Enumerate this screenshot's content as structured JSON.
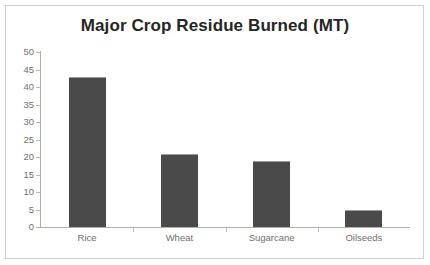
{
  "figure": {
    "background_color": "#ffffff",
    "frame_color": "#cfcfcf",
    "title": "Major Crop Residue Burned (MT)"
  },
  "chart_data": {
    "type": "bar",
    "title": "Major Crop Residue Burned (MT)",
    "subtitle": "",
    "xlabel": "",
    "ylabel": "",
    "categories": [
      "Rice",
      "Wheat",
      "Sugarcane",
      "Oilseeds"
    ],
    "values": [
      43,
      21,
      19,
      5
    ],
    "series": [
      {
        "name": "Major Crop Residue Burned (MT)",
        "values": [
          43,
          21,
          19,
          5
        ],
        "color": "#4a4a4a"
      }
    ],
    "ylim": [
      0,
      50
    ],
    "ytick_step": 5,
    "ytick_labels": [
      "50",
      "45",
      "40",
      "35",
      "30",
      "25",
      "20",
      "15",
      "10",
      "5",
      "0"
    ],
    "ytick_values": [
      50,
      45,
      40,
      35,
      30,
      25,
      20,
      15,
      10,
      5,
      0
    ],
    "grid": false,
    "legend": false,
    "legend_position": "none",
    "axis_color": "#b0b0b0",
    "tick_label_color": "#6f6f6f",
    "annotations": [],
    "data_labels": false
  }
}
